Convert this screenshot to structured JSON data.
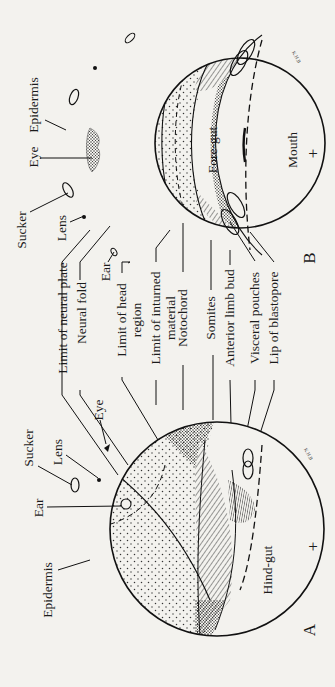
{
  "figure": {
    "panels": [
      {
        "id": "A",
        "letter": "A",
        "plus": "+",
        "cavity_label": "Hind-gut",
        "labels": {
          "sucker": "Sucker",
          "lens": "Lens",
          "ear": "Ear",
          "eye": "Eye",
          "epidermis": "Epidermis"
        },
        "artist_initials": "K.H.B"
      },
      {
        "id": "B",
        "letter": "B",
        "plus": "+",
        "cavity_label": "Fore-gut",
        "mouth_label": "Mouth",
        "labels": {
          "sucker": "Sucker",
          "lens": "Lens",
          "ear": "Ear",
          "eye": "Eye",
          "epidermis": "Epidermis"
        },
        "artist_initials": "K.H.B"
      }
    ],
    "shared_labels": [
      "Limit of neural plate",
      "Neural fold",
      "Limit of head",
      "region",
      "Limit of inturned",
      "material",
      "Notochord",
      "Somites",
      "Anterior limb bud",
      "Visceral pouches",
      "Lip of blastopore"
    ]
  }
}
